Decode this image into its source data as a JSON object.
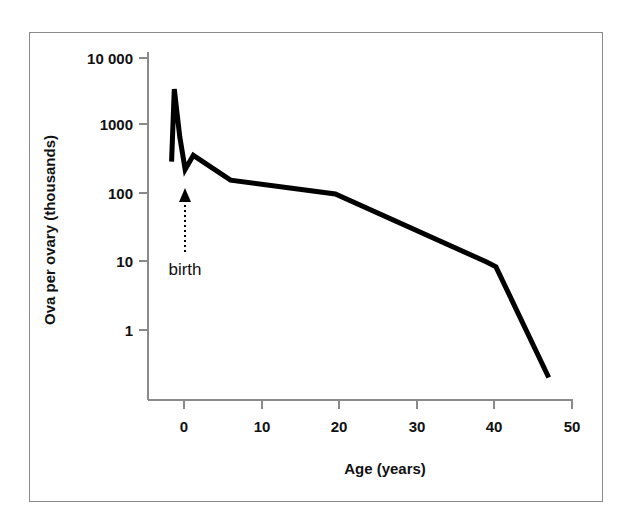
{
  "figure": {
    "border_color": "#8a8a8a",
    "background": "#ffffff"
  },
  "chart_data": {
    "type": "line",
    "title": "",
    "xlabel": "Age (years)",
    "ylabel": "Ova per ovary (thousands)",
    "xlim": [
      -2.5,
      50
    ],
    "ylim": [
      0.2,
      10000
    ],
    "yscale": "log",
    "xscale": "linear",
    "grid": false,
    "legend": false,
    "line_color": "#000000",
    "line_width": 5,
    "axis_color": "#8a8a8a",
    "xticks": [
      0,
      10,
      20,
      30,
      40,
      50
    ],
    "xtick_labels": [
      "0",
      "10",
      "20",
      "30",
      "40",
      "50"
    ],
    "yticks": [
      1,
      10,
      100,
      1000,
      10000
    ],
    "ytick_labels": [
      "1",
      "10",
      "100",
      "1000",
      "10 000"
    ],
    "series": [
      {
        "name": "Ova per ovary",
        "x": [
          -1.6,
          -1.25,
          -0.55,
          0.15,
          1.2,
          6.0,
          19.5,
          39.0,
          40.2,
          47.0
        ],
        "y": [
          300,
          3500,
          700,
          230,
          370,
          160,
          100,
          10,
          8.5,
          0.2
        ]
      }
    ],
    "annotations": [
      {
        "text": "birth",
        "x": 0,
        "y": 110,
        "arrow": "up",
        "arrow_style": "dotted",
        "arrow_from_y": 11,
        "arrow_to_y": 110
      }
    ]
  }
}
